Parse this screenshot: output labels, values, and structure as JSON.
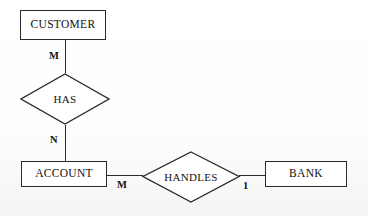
{
  "diagram": {
    "type": "er-diagram",
    "stroke_color": "#2b2b2b",
    "text_color": "#111111",
    "background_color": "#fdfdfc"
  },
  "entities": [
    {
      "id": "customer",
      "label": "CUSTOMER",
      "shape": "rectangle"
    },
    {
      "id": "account",
      "label": "ACCOUNT",
      "shape": "rectangle"
    },
    {
      "id": "bank",
      "label": "BANK",
      "shape": "rectangle"
    }
  ],
  "relationships": [
    {
      "id": "has",
      "label": "HAS",
      "shape": "diamond"
    },
    {
      "id": "handles",
      "label": "HANDLES",
      "shape": "diamond"
    }
  ],
  "cardinalities": [
    {
      "id": "customer-has",
      "label": "M"
    },
    {
      "id": "has-account",
      "label": "N"
    },
    {
      "id": "account-handles",
      "label": "M"
    },
    {
      "id": "handles-bank",
      "label": "1"
    }
  ],
  "connections": [
    {
      "from": "customer",
      "to": "has",
      "cardinality": "M",
      "orientation": "vertical"
    },
    {
      "from": "has",
      "to": "account",
      "cardinality": "N",
      "orientation": "vertical"
    },
    {
      "from": "account",
      "to": "handles",
      "cardinality": "M",
      "orientation": "horizontal"
    },
    {
      "from": "handles",
      "to": "bank",
      "cardinality": "1",
      "orientation": "horizontal"
    }
  ]
}
